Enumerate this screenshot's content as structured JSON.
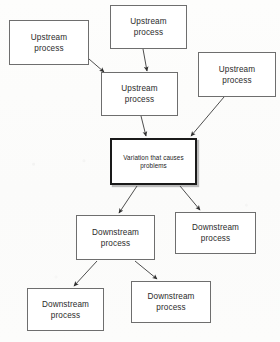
{
  "diagram": {
    "background_color": "#fcfcfb",
    "node_border_color": "#6e6e6e",
    "emphasis_border_color": "#1a1a1a",
    "arrow_color": "#3a3a3a",
    "nodes": [
      {
        "id": "upstream-top-left",
        "label": "Upstream\nprocess",
        "x": 9,
        "y": 20,
        "w": 80,
        "h": 45,
        "emphasis": false
      },
      {
        "id": "upstream-top-middle",
        "label": "Upstream\nprocess",
        "x": 110,
        "y": 5,
        "w": 77,
        "h": 44,
        "emphasis": false
      },
      {
        "id": "upstream-top-right",
        "label": "Upstream\nprocess",
        "x": 198,
        "y": 52,
        "w": 78,
        "h": 45,
        "emphasis": false
      },
      {
        "id": "upstream-middle",
        "label": "Upstream\nprocess",
        "x": 101,
        "y": 72,
        "w": 77,
        "h": 44,
        "emphasis": false
      },
      {
        "id": "variation-center",
        "label": "Variation that causes\nproblems",
        "x": 110,
        "y": 138,
        "w": 87,
        "h": 47,
        "emphasis": true
      },
      {
        "id": "downstream-middle",
        "label": "Downstream\nprocess",
        "x": 76,
        "y": 215,
        "w": 79,
        "h": 45,
        "emphasis": false
      },
      {
        "id": "downstream-right",
        "label": "Downstream\nprocess",
        "x": 175,
        "y": 212,
        "w": 81,
        "h": 42,
        "emphasis": false
      },
      {
        "id": "downstream-bottom-left",
        "label": "Downstream\nprocess",
        "x": 27,
        "y": 288,
        "w": 77,
        "h": 43,
        "emphasis": false
      },
      {
        "id": "downstream-bottom-middle",
        "label": "Downstream\nprocess",
        "x": 131,
        "y": 281,
        "w": 80,
        "h": 42,
        "emphasis": false
      }
    ],
    "arrows": [
      {
        "id": "arrow-top-left-to-upstream-middle",
        "from": "upstream-top-left",
        "to": "upstream-middle",
        "x1": 89,
        "y1": 59,
        "x2": 104,
        "y2": 72
      },
      {
        "id": "arrow-top-middle-to-upstream-middle",
        "from": "upstream-top-middle",
        "to": "upstream-middle",
        "x1": 143,
        "y1": 49,
        "x2": 147,
        "y2": 71
      },
      {
        "id": "arrow-top-right-to-variation",
        "from": "upstream-top-right",
        "to": "variation-center",
        "x1": 224,
        "y1": 97,
        "x2": 191,
        "y2": 136
      },
      {
        "id": "arrow-upstream-middle-to-variation",
        "from": "upstream-middle",
        "to": "variation-center",
        "x1": 141,
        "y1": 116,
        "x2": 146,
        "y2": 136
      },
      {
        "id": "arrow-variation-to-downstream-middle",
        "from": "variation-center",
        "to": "downstream-middle",
        "x1": 137,
        "y1": 186,
        "x2": 119,
        "y2": 213
      },
      {
        "id": "arrow-variation-to-downstream-right",
        "from": "variation-center",
        "to": "downstream-right",
        "x1": 180,
        "y1": 186,
        "x2": 200,
        "y2": 210
      },
      {
        "id": "arrow-downstream-middle-to-bottom-left",
        "from": "downstream-middle",
        "to": "downstream-bottom-left",
        "x1": 97,
        "y1": 261,
        "x2": 74,
        "y2": 286
      },
      {
        "id": "arrow-downstream-middle-to-bottom-middle",
        "from": "downstream-middle",
        "to": "downstream-bottom-middle",
        "x1": 135,
        "y1": 261,
        "x2": 157,
        "y2": 279
      }
    ]
  }
}
